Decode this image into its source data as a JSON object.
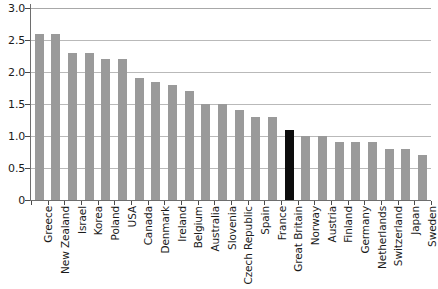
{
  "chart_data": {
    "type": "bar",
    "title": "",
    "subtitle": "",
    "xlabel": "",
    "ylabel": "",
    "ylim": [
      0,
      3.0
    ],
    "y_ticks": [
      "0",
      "0.5",
      "1.0",
      "1.5",
      "2.0",
      "2.5",
      "3.0"
    ],
    "y_tick_values": [
      0,
      0.5,
      1.0,
      1.5,
      2.0,
      2.5,
      3.0
    ],
    "grid": true,
    "grid_axis": "y",
    "legend": "none",
    "categories": [
      "Greece",
      "New Zealand",
      "Israel",
      "Korea",
      "Poland",
      "USA",
      "Canada",
      "Denmark",
      "Ireland",
      "Belgium",
      "Australia",
      "Slovenia",
      "Czech Republic",
      "Spain",
      "France",
      "Great Britain",
      "Norway",
      "Austria",
      "Finland",
      "Germany",
      "Netherlands",
      "Switzerland",
      "Japan",
      "Sweden"
    ],
    "values": [
      2.6,
      2.6,
      2.3,
      2.3,
      2.2,
      2.2,
      1.9,
      1.85,
      1.8,
      1.7,
      1.5,
      1.5,
      1.4,
      1.3,
      1.3,
      1.1,
      1.0,
      1.0,
      0.9,
      0.9,
      0.9,
      0.8,
      0.8,
      0.7
    ],
    "highlight_category": "Great Britain",
    "highlight_index": 15,
    "colors": {
      "bar": "#9a9a9a",
      "highlight_bar": "#0d0d0d",
      "gridline": "#b9b9b9",
      "axis": "#6e6e6e",
      "text": "#1a1a1a",
      "background": "#ffffff"
    }
  }
}
